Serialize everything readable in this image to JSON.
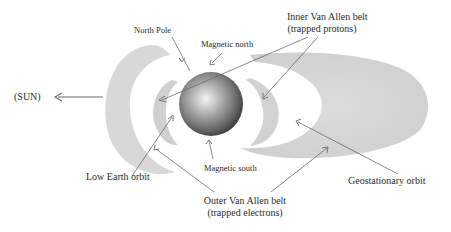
{
  "diagram": {
    "labels": {
      "sun": "(SUN)",
      "north_pole": "North Pole",
      "magnetic_north": "Magnetic north",
      "inner_belt_line1": "Inner Van Allen belt",
      "inner_belt_line2": "(trapped protons)",
      "low_earth_orbit": "Low Earth orbit",
      "magnetic_south": "Magnetic south",
      "outer_belt_line1": "Outer Van Allen belt",
      "outer_belt_line2": "(trapped electrons)",
      "geostationary_orbit": "Geostationary orbit"
    },
    "colors": {
      "earth_dark": "#3a3a3a",
      "earth_light": "#f4f4f4",
      "belt_fill": "#d4d4d4",
      "arrow": "#6a6a6a",
      "background": "#ffffff"
    }
  }
}
